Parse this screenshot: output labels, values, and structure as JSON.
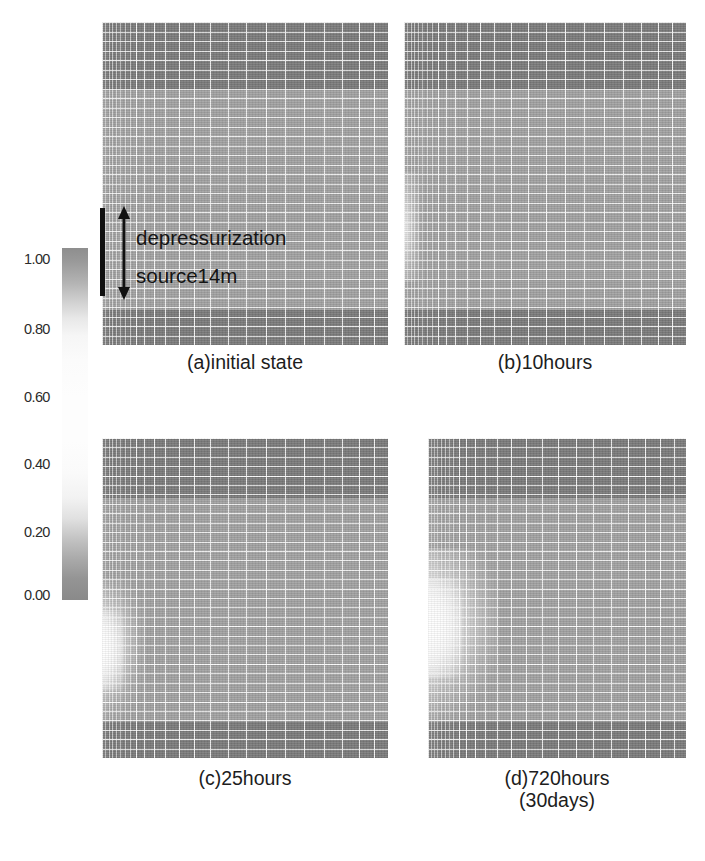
{
  "figure": {
    "kind": "reservoir-simulation-grid-figure",
    "colorbar": {
      "name": "grayscale-colorbar",
      "orientation": "vertical",
      "min": 0.0,
      "max": 1.0,
      "ticks": [
        "1.00",
        "0.80",
        "0.60",
        "0.40",
        "0.20",
        "0.00"
      ],
      "tick_values": [
        1.0,
        0.8,
        0.6,
        0.4,
        0.2,
        0.0
      ],
      "colors": {
        "high": "#8e8e8e",
        "mid": "#fdfdfd",
        "low": "#8a8a8a"
      }
    },
    "annotation": {
      "line1": "depressurization",
      "line2": "source14m",
      "bar_color": "#111111",
      "arrow": "double-headed-vertical"
    },
    "panels": [
      {
        "id": "a",
        "caption": "(a)initial state"
      },
      {
        "id": "b",
        "caption": "(b)10hours"
      },
      {
        "id": "c",
        "caption": "(c)25hours"
      },
      {
        "id": "d",
        "caption": "(d)720hours\n(30days)"
      }
    ]
  },
  "chart_data": {
    "type": "heatmap",
    "title": "",
    "xlabel": "",
    "ylabel": "",
    "colorbar": {
      "label": "",
      "ticks": [
        1.0,
        0.8,
        0.6,
        0.4,
        0.2,
        0.0
      ],
      "tick_labels": [
        "1.00",
        "0.80",
        "0.60",
        "0.40",
        "0.20",
        "0.00"
      ],
      "range": [
        0.0,
        1.0
      ],
      "colormap": "grayscale-dark-light-dark"
    },
    "grid": true,
    "legend_position": "left",
    "panels": [
      {
        "label": "(a)initial state",
        "time_hours": 0,
        "layers": [
          {
            "name": "cap-rock",
            "value": 0.05,
            "y_frac": [
              0.0,
              0.21
            ]
          },
          {
            "name": "hydrate-reservoir",
            "value": 0.6,
            "y_frac": [
              0.21,
              0.88
            ]
          },
          {
            "name": "base-rock",
            "value": 0.05,
            "y_frac": [
              0.88,
              1.0
            ]
          }
        ],
        "plume": null
      },
      {
        "label": "(b)10hours",
        "time_hours": 10,
        "layers": [
          {
            "name": "cap-rock",
            "value": 0.05,
            "y_frac": [
              0.0,
              0.21
            ]
          },
          {
            "name": "hydrate-reservoir",
            "value": 0.6,
            "y_frac": [
              0.21,
              0.88
            ]
          },
          {
            "name": "base-rock",
            "value": 0.05,
            "y_frac": [
              0.88,
              1.0
            ]
          }
        ],
        "plume": {
          "name": "dissociation-front",
          "value": 0.95,
          "extent_x_frac": 0.03,
          "center_y_frac": 0.55
        }
      },
      {
        "label": "(c)25hours",
        "time_hours": 25,
        "layers": [
          {
            "name": "cap-rock",
            "value": 0.05,
            "y_frac": [
              0.0,
              0.19
            ]
          },
          {
            "name": "hydrate-reservoir",
            "value": 0.6,
            "y_frac": [
              0.19,
              0.88
            ]
          },
          {
            "name": "base-rock",
            "value": 0.05,
            "y_frac": [
              0.88,
              1.0
            ]
          }
        ],
        "plume": {
          "name": "dissociation-front",
          "value": 0.98,
          "extent_x_frac": 0.1,
          "center_y_frac": 0.55
        }
      },
      {
        "label": "(d)720hours\n(30days)",
        "time_hours": 720,
        "layers": [
          {
            "name": "cap-rock",
            "value": 0.05,
            "y_frac": [
              0.0,
              0.19
            ]
          },
          {
            "name": "hydrate-reservoir",
            "value": 0.6,
            "y_frac": [
              0.19,
              0.88
            ]
          },
          {
            "name": "base-rock",
            "value": 0.05,
            "y_frac": [
              0.88,
              1.0
            ]
          }
        ],
        "plume": {
          "name": "dissociation-front",
          "value": 1.0,
          "extent_x_frac": 0.22,
          "center_y_frac": 0.5
        }
      }
    ],
    "column_edges_frac": [
      0.0,
      0.012,
      0.024,
      0.036,
      0.05,
      0.064,
      0.08,
      0.098,
      0.12,
      0.148,
      0.182,
      0.222,
      0.268,
      0.32,
      0.378,
      0.44,
      0.505,
      0.572,
      0.64,
      0.708,
      0.775,
      0.84,
      0.9,
      0.952,
      1.0
    ],
    "row_count": 34
  }
}
